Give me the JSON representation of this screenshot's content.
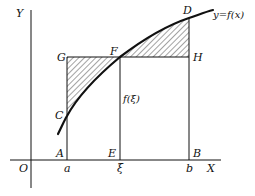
{
  "diagram": {
    "curve_label": "y=f(x)",
    "axes": {
      "x_label": "X",
      "y_label": "Y",
      "origin_label": "O"
    },
    "points": {
      "A": "A",
      "B": "B",
      "C": "C",
      "D": "D",
      "E": "E",
      "F": "F",
      "G": "G",
      "H": "H"
    },
    "x_ticks": {
      "a": "a",
      "xi": "ξ",
      "b": "b"
    },
    "ordinate_label": "f(ξ)",
    "colors": {
      "line": "#111111",
      "hatch": "#333333",
      "background": "#ffffff"
    }
  }
}
